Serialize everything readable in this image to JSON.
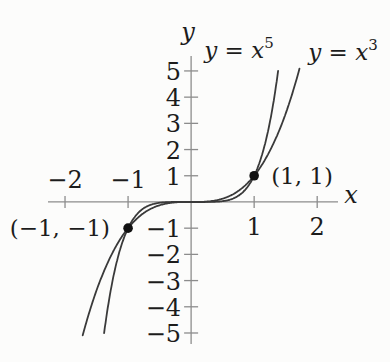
{
  "chart_data": {
    "type": "line",
    "title": "",
    "xlabel": "x",
    "ylabel": "y",
    "xlim": [
      -2.27,
      2.33
    ],
    "ylim": [
      -5.42,
      5.57
    ],
    "x_ticks": [
      -2,
      -1,
      1,
      2
    ],
    "y_ticks": [
      -5,
      -4,
      -3,
      -2,
      -1,
      1,
      2,
      3,
      4,
      5
    ],
    "grid": false,
    "legend_position": "labels-near-curves-top",
    "series": [
      {
        "name": "y = x^5",
        "exponent": 5,
        "x_range": [
          -1.38,
          1.38
        ]
      },
      {
        "name": "y = x^3",
        "exponent": 3,
        "x_range": [
          -1.72,
          1.72
        ]
      }
    ],
    "marked_points": [
      {
        "x": 1,
        "y": 1,
        "label": "(1, 1)",
        "label_side": "right"
      },
      {
        "x": -1,
        "y": -1,
        "label": "(−1, −1)",
        "label_side": "left"
      }
    ],
    "colors": {
      "curve": "#3a3a3a",
      "axis": "#8c8c8c",
      "text": "#1c1c1c",
      "point": "#111111",
      "background": "#fcfcfb"
    }
  }
}
